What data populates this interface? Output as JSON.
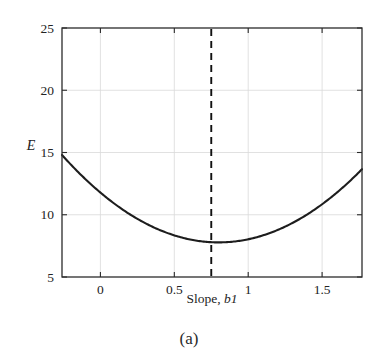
{
  "figure": {
    "caption": "(a)",
    "background_color": "#ffffff",
    "curve_color": "#1d1d1d",
    "axis_color": "#2b2b2b",
    "grid_color": "#d9d9d9",
    "marker_line_color": "#111111"
  },
  "chart_data": {
    "type": "line",
    "title": "",
    "subtitle": "",
    "xlabel_prefix": "Slope, ",
    "xlabel_symbol": "b1",
    "xlabel": "Slope, b1",
    "ylabel": "E",
    "xlim": [
      -0.26,
      1.77
    ],
    "ylim": [
      5,
      25
    ],
    "xticks": [
      0,
      0.5,
      1,
      1.5
    ],
    "xtick_labels": [
      "0",
      "0.5",
      "1",
      "1.5"
    ],
    "yticks": [
      5,
      10,
      15,
      20,
      25
    ],
    "ytick_labels": [
      "5",
      "10",
      "15",
      "20",
      "25"
    ],
    "grid": true,
    "legend": null,
    "annotations": [
      {
        "name": "minimum-marker",
        "type": "vertical-dashed-line",
        "x": 0.75,
        "label": ""
      }
    ],
    "series": [
      {
        "name": "Error E vs slope b1",
        "style": "solid",
        "x": [
          -0.26,
          -0.15,
          -0.05,
          0.05,
          0.15,
          0.25,
          0.35,
          0.45,
          0.55,
          0.65,
          0.75,
          0.85,
          0.95,
          1.05,
          1.15,
          1.25,
          1.35,
          1.45,
          1.55,
          1.65,
          1.77
        ],
        "values": [
          21.4,
          19.4,
          17.7,
          16.1,
          14.6,
          13.3,
          12.0,
          10.9,
          9.8,
          8.9,
          8.1,
          7.8,
          7.9,
          8.3,
          9.0,
          10.1,
          11.5,
          13.2,
          15.2,
          17.5,
          21.4
        ]
      }
    ],
    "fit": {
      "form": "quadratic",
      "vertex_x": 0.8,
      "vertex_y": 7.78,
      "curvature": 6.25
    }
  }
}
